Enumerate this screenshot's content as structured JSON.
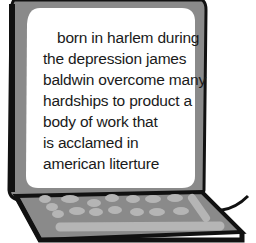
{
  "illustration": {
    "subject": "laptop-computer",
    "colors": {
      "frame": "#8a8a8a",
      "outline": "#111111",
      "screen": "#ffffff",
      "keys": "#b5b5b5",
      "keyboard": "#8a8a8a"
    }
  },
  "screen": {
    "lines": [
      "born in harlem during",
      "the depression james",
      "baldwin overcome many",
      "hardships to product a",
      "body of work that",
      "is acclamed in",
      "american literture"
    ]
  }
}
